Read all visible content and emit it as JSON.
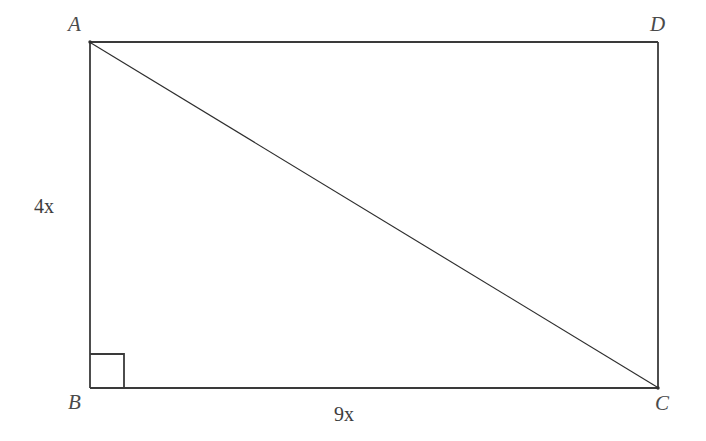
{
  "figure": {
    "kind": "geometry-diagram",
    "background_color": "#ffffff",
    "line_color": "#3a3a3a",
    "text_color": "#4a4a4a"
  },
  "vertices": {
    "A": {
      "label": "A",
      "x": 90,
      "y": 42
    },
    "D": {
      "label": "D",
      "x": 658,
      "y": 42
    },
    "B": {
      "label": "B",
      "x": 90,
      "y": 388
    },
    "C": {
      "label": "C",
      "x": 658,
      "y": 388
    }
  },
  "sides": {
    "left": {
      "label": "4x",
      "from": "A",
      "to": "B"
    },
    "bottom": {
      "label": "9x",
      "from": "B",
      "to": "C"
    }
  },
  "diagonal": {
    "from": "A",
    "to": "C",
    "name": "diagonal-AC"
  },
  "right_angle_marker": {
    "at_vertex": "B",
    "size": 34
  }
}
